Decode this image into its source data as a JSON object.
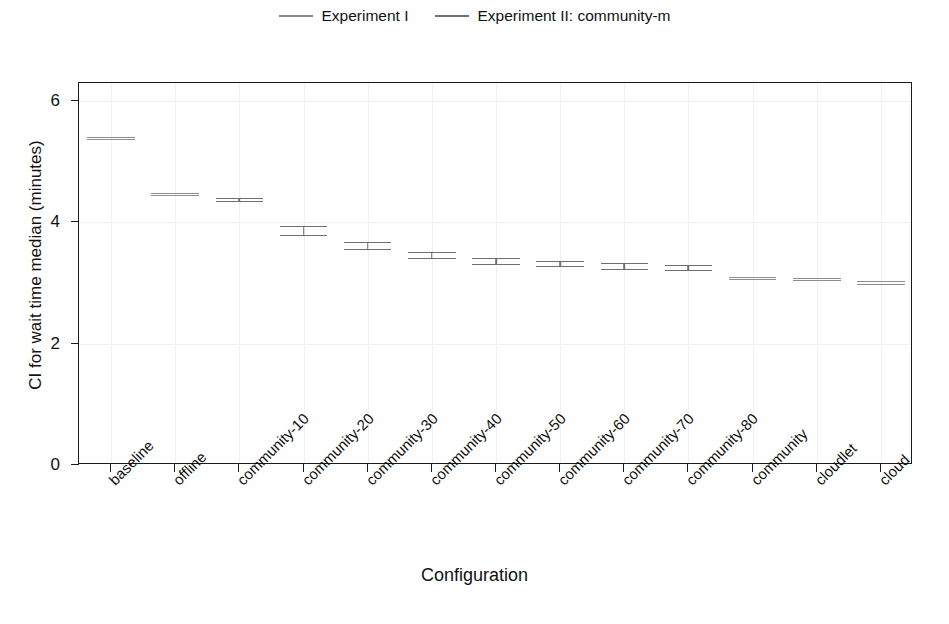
{
  "chart_data": {
    "type": "line",
    "title": "",
    "xlabel": "Configuration",
    "ylabel": "CI for wait time median (minutes)",
    "ylim": [
      0,
      6.3
    ],
    "yticks": [
      0,
      2,
      4,
      6
    ],
    "ytick_labels": [
      "0",
      "2",
      "4",
      "6"
    ],
    "grid": true,
    "legend_position": "top-center",
    "legend": [
      {
        "name": "Experiment I",
        "color": "#8d8d8d"
      },
      {
        "name": "Experiment II: community-m",
        "color": "#6f6f6f"
      }
    ],
    "categories": [
      "baseline",
      "offline",
      "community-10",
      "community-20",
      "community-30",
      "community-40",
      "community-50",
      "community-60",
      "community-70",
      "community-80",
      "community",
      "cloudlet",
      "cloud"
    ],
    "note": "Each mark is a confidence interval drawn as an upper bound line, a lower bound line, and a connecting vertical stem. Series 1 (Experiment I) covers baseline, offline, community, cloudlet, cloud. Series 2 (Experiment II: community-m) covers community-10 through community-80.",
    "series": [
      {
        "name": "Experiment I",
        "color": "#8d8d8d",
        "points": [
          {
            "category": "baseline",
            "ci_low": 5.37,
            "ci_high": 5.41,
            "median": 5.39
          },
          {
            "category": "offline",
            "ci_low": 4.45,
            "ci_high": 4.49,
            "median": 4.47
          },
          {
            "category": "community",
            "ci_low": 3.06,
            "ci_high": 3.1,
            "median": 3.08
          },
          {
            "category": "cloudlet",
            "ci_low": 3.05,
            "ci_high": 3.09,
            "median": 3.07
          },
          {
            "category": "cloud",
            "ci_low": 2.99,
            "ci_high": 3.03,
            "median": 3.01
          }
        ]
      },
      {
        "name": "Experiment II: community-m",
        "color": "#6f6f6f",
        "points": [
          {
            "category": "community-10",
            "ci_low": 4.35,
            "ci_high": 4.41,
            "median": 4.38
          },
          {
            "category": "community-20",
            "ci_low": 3.79,
            "ci_high": 3.94,
            "median": 3.86
          },
          {
            "category": "community-30",
            "ci_low": 3.56,
            "ci_high": 3.67,
            "median": 3.61
          },
          {
            "category": "community-40",
            "ci_low": 3.41,
            "ci_high": 3.51,
            "median": 3.46
          },
          {
            "category": "community-50",
            "ci_low": 3.32,
            "ci_high": 3.41,
            "median": 3.37
          },
          {
            "category": "community-60",
            "ci_low": 3.28,
            "ci_high": 3.37,
            "median": 3.33
          },
          {
            "category": "community-70",
            "ci_low": 3.24,
            "ci_high": 3.33,
            "median": 3.29
          },
          {
            "category": "community-80",
            "ci_low": 3.21,
            "ci_high": 3.3,
            "median": 3.26
          }
        ]
      }
    ]
  }
}
